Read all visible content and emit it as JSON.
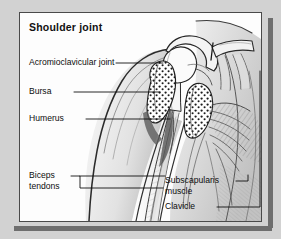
{
  "figure": {
    "title": "Shoulder joint",
    "type": "anatomical-illustration",
    "style": "black and white pen-and-ink medical drawing",
    "colors": {
      "page_background": "#d2d2d2",
      "panel_background": "#fdfdfd",
      "panel_border": "#4a4a4a",
      "shadow": "#6e6e6e",
      "ink": "#0d0d0d"
    }
  },
  "labels": {
    "acromioclavicular_joint": "Acromioclavicular joint",
    "bursa": "Bursa",
    "humerus": "Humerus",
    "biceps_line1": "Biceps",
    "biceps_line2": "tendons",
    "subscapularis_line1": "Subscapularis",
    "subscapularis_line2": "muscle",
    "clavicle": "Clavicle"
  }
}
